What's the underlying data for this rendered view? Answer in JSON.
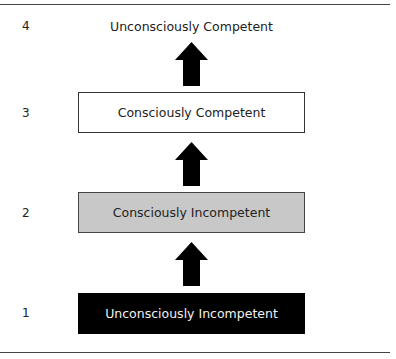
{
  "diagram": {
    "type": "stages-of-competence",
    "levels": [
      {
        "number": "4",
        "label": "Unconsciously Competent",
        "style": "plain"
      },
      {
        "number": "3",
        "label": "Consciously Competent",
        "style": "white-box"
      },
      {
        "number": "2",
        "label": "Consciously Incompetent",
        "style": "gray-box"
      },
      {
        "number": "1",
        "label": "Unconsciously Incompetent",
        "style": "black-box"
      }
    ],
    "arrows": [
      {
        "from": "3",
        "to": "4",
        "direction": "up"
      },
      {
        "from": "2",
        "to": "3",
        "direction": "up"
      },
      {
        "from": "1",
        "to": "2",
        "direction": "up"
      }
    ],
    "colors": {
      "white_box": "#ffffff",
      "gray_box": "#c8c8c8",
      "black_box": "#000000",
      "arrow": "#000000"
    }
  }
}
